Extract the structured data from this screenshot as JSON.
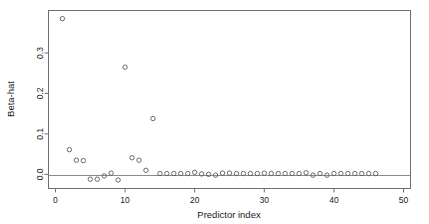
{
  "chart_data": {
    "type": "scatter",
    "title": "",
    "xlabel": "Predictor index",
    "ylabel": "Beta-hat",
    "xlim": [
      -1,
      51
    ],
    "ylim": [
      -0.035,
      0.405
    ],
    "xticks": [
      0,
      10,
      20,
      30,
      40,
      50
    ],
    "yticks": [
      0.0,
      0.1,
      0.2,
      0.3
    ],
    "xtick_labels": [
      "0",
      "10",
      "20",
      "30",
      "40",
      "50"
    ],
    "ytick_labels": [
      "0.0",
      "0.1",
      "0.2",
      "0.3"
    ],
    "grid": false,
    "legend": null,
    "marker": "open-circle",
    "marker_color": "#5a5a5a",
    "frame_color": "#6e6e6e",
    "reference_line": {
      "orientation": "horizontal",
      "y": 0.0,
      "color": "#8a8a8a"
    },
    "x": [
      1,
      2,
      3,
      4,
      5,
      6,
      7,
      8,
      9,
      10,
      11,
      12,
      13,
      14,
      15,
      16,
      17,
      18,
      19,
      20,
      21,
      22,
      23,
      24,
      25,
      26,
      27,
      28,
      29,
      30,
      31,
      32,
      33,
      34,
      35,
      36,
      37,
      38,
      39,
      40,
      41,
      42,
      43,
      44,
      45,
      46
    ],
    "values": [
      0.385,
      0.061,
      0.035,
      0.034,
      -0.012,
      -0.012,
      -0.004,
      0.003,
      -0.014,
      0.265,
      0.041,
      0.035,
      0.01,
      0.138,
      0.002,
      0.002,
      0.002,
      0.002,
      0.002,
      0.005,
      0.001,
      0.0,
      -0.002,
      0.003,
      0.003,
      0.002,
      0.002,
      0.002,
      0.002,
      0.003,
      0.002,
      0.002,
      0.002,
      0.002,
      0.002,
      0.004,
      -0.002,
      0.002,
      -0.002,
      0.002,
      0.002,
      0.002,
      0.002,
      0.002,
      0.002,
      0.002
    ]
  }
}
